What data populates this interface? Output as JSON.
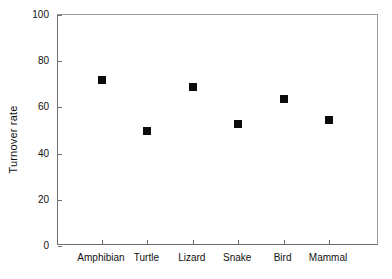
{
  "chart_data": {
    "type": "scatter",
    "title": "",
    "xlabel": "",
    "ylabel": "Turnover rate",
    "categories": [
      "Amphibian",
      "Turtle",
      "Lizard",
      "Snake",
      "Bird",
      "Mammal"
    ],
    "values": [
      72,
      50,
      69,
      53,
      63.5,
      54.5
    ],
    "ylim": [
      0,
      100
    ],
    "yticks": [
      0,
      20,
      40,
      60,
      80,
      100
    ],
    "ytick_labels": [
      "0",
      "20",
      "40",
      "60",
      "80",
      "100"
    ],
    "grid": false,
    "legend": null,
    "marker": "filled-square",
    "marker_color": "#0c0c0c",
    "axis_color": "#6e6e6e",
    "background": "#ffffff",
    "series": [
      {
        "name": "Turnover rate",
        "points": [
          {
            "category": "Amphibian",
            "value": 72
          },
          {
            "category": "Turtle",
            "value": 50
          },
          {
            "category": "Lizard",
            "value": 69
          },
          {
            "category": "Snake",
            "value": 53
          },
          {
            "category": "Bird",
            "value": 63.5
          },
          {
            "category": "Mammal",
            "value": 54.5
          }
        ]
      }
    ]
  }
}
